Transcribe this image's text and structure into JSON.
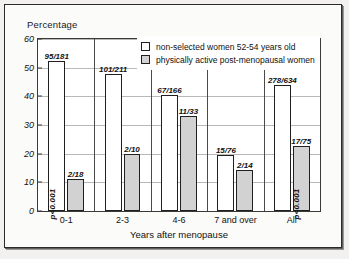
{
  "chart_data": {
    "type": "bar",
    "title": "",
    "ylabel": "Percentage",
    "xlabel": "Years after menopause",
    "categories": [
      "0-1",
      "2-3",
      "4-6",
      "7 and over",
      "All"
    ],
    "ylim": [
      0,
      60
    ],
    "yticks": [
      0,
      10,
      20,
      30,
      40,
      50,
      60
    ],
    "grid": true,
    "legend_position": "top-right",
    "series": [
      {
        "name": "non-selected women 52-54 years old",
        "swatch": "white",
        "values": [
          52.5,
          47.9,
          40.4,
          19.7,
          43.8
        ],
        "labels": [
          "95/181",
          "101/211",
          "67/166",
          "15/76",
          "278/634"
        ]
      },
      {
        "name": "physically active post-menopausal women",
        "swatch": "gray",
        "values": [
          11.1,
          20.0,
          33.3,
          14.3,
          22.7
        ],
        "labels": [
          "2/18",
          "2/10",
          "11/33",
          "2/14",
          "17/75"
        ]
      }
    ],
    "annotations": [
      {
        "text": "p<0.001",
        "group": "0-1",
        "series": 0,
        "orientation": "vertical"
      },
      {
        "text": "p<0.001",
        "group": "All",
        "series": 1,
        "orientation": "vertical"
      }
    ],
    "colors": {
      "series_white_fill": "#ffffff",
      "series_gray_fill": "#d2d2d2",
      "bar_outline": "#1f1f1f",
      "gridline": "#b8b8b8",
      "axis": "#3a3a3a",
      "text": "#111111",
      "page_background": "#fbfbfa"
    }
  },
  "legend": {
    "items": [
      {
        "label": "non-selected women 52-54 years old"
      },
      {
        "label": "physically active post-menopausal women"
      }
    ]
  }
}
